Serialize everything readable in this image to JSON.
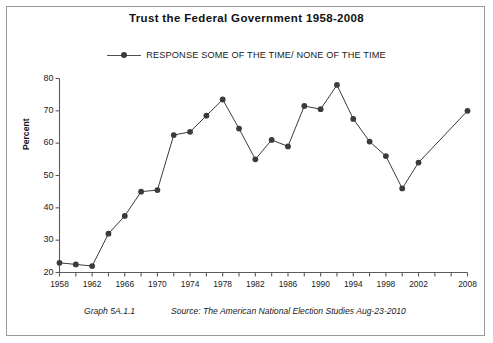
{
  "chart_data": {
    "type": "line",
    "title": "Trust the Federal Government 1958-2008",
    "xlabel": "",
    "ylabel": "Percent",
    "ylim": [
      20,
      80
    ],
    "ytick_values": [
      20,
      30,
      40,
      50,
      60,
      70,
      80
    ],
    "xlim": [
      1958,
      2008
    ],
    "xtick_values": [
      1958,
      1960,
      1962,
      1964,
      1966,
      1968,
      1970,
      1972,
      1974,
      1976,
      1978,
      1980,
      1982,
      1984,
      1986,
      1988,
      1990,
      1992,
      1994,
      1996,
      1998,
      2000,
      2002,
      2004,
      2006,
      2008
    ],
    "xtick_labels": [
      "1958",
      "",
      "1962",
      "",
      "1966",
      "",
      "1970",
      "",
      "1974",
      "",
      "1978",
      "",
      "1982",
      "",
      "1986",
      "",
      "1990",
      "",
      "1994",
      "",
      "1998",
      "",
      "2002",
      "",
      "",
      "2008"
    ],
    "grid": false,
    "legend_position": "top-center",
    "series": [
      {
        "name": "RESPONSE  SOME OF THE TIME/ NONE OF THE TIME",
        "color": "#3b3b3b",
        "marker": "circle",
        "x": [
          1958,
          1960,
          1962,
          1964,
          1966,
          1968,
          1970,
          1972,
          1974,
          1976,
          1978,
          1980,
          1982,
          1984,
          1986,
          1988,
          1990,
          1992,
          1994,
          1996,
          1998,
          2000,
          2002,
          2008
        ],
        "values": [
          23,
          22.5,
          22,
          32,
          37.5,
          45,
          45.5,
          62.5,
          63.5,
          68.5,
          73.5,
          64.5,
          55,
          61,
          59,
          71.5,
          70.5,
          78,
          67.5,
          60.5,
          56,
          46,
          54,
          70
        ]
      }
    ]
  },
  "chart": {
    "title": "Trust the Federal Government 1958-2008",
    "legend_label": "RESPONSE  SOME OF THE TIME/ NONE OF THE TIME",
    "ylabel": "Percent"
  },
  "footer": {
    "graph_number": "Graph 5A.1.1",
    "source": "Source:  The American National Election Studies   Aug-23-2010"
  },
  "colors": {
    "line": "#4d4d4d",
    "marker": "#3b3b3b",
    "axis": "#5a5a5a",
    "border": "#9a9a9a",
    "text": "#1a1a1a"
  }
}
